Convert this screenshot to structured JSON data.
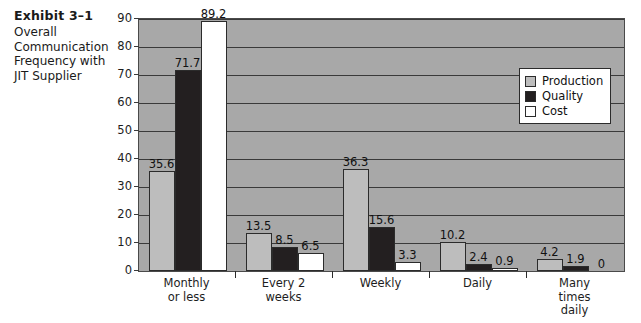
{
  "caption": {
    "exhibit_number": "Exhibit 3–1",
    "description": "Overall\nCommunication\nFrequency with\nJIT Supplier"
  },
  "legend": {
    "position": "inside-top-right",
    "items": [
      {
        "label": "Production",
        "color": "#bdbdbd",
        "icon": "square-swatch"
      },
      {
        "label": "Quality",
        "color": "#231f20",
        "icon": "square-swatch"
      },
      {
        "label": "Cost",
        "color": "#ffffff",
        "icon": "square-swatch"
      }
    ]
  },
  "chart_data": {
    "type": "bar",
    "title": "Overall Communication Frequency with JIT Supplier",
    "xlabel": "",
    "ylabel": "",
    "ylim": [
      0,
      90
    ],
    "yticks": [
      0,
      10,
      20,
      30,
      40,
      50,
      60,
      70,
      80,
      90
    ],
    "ytick_labels": [
      "0",
      "10",
      "20",
      "30",
      "40",
      "50",
      "60",
      "70",
      "80",
      "90"
    ],
    "grid": true,
    "grid_axis": "y",
    "legend_position": "inside-top-right",
    "plot_background": "#a8a8a8",
    "categories": [
      "Monthly\nor less",
      "Every 2\nweeks",
      "Weekly",
      "Daily",
      "Many\ntimes\ndaily"
    ],
    "series": [
      {
        "name": "Production",
        "color": "#bdbdbd",
        "values": [
          35.6,
          13.5,
          36.3,
          10.2,
          4.2
        ],
        "labels": [
          "35.6",
          "13.5",
          "36.3",
          "10.2",
          "4.2"
        ]
      },
      {
        "name": "Quality",
        "color": "#231f20",
        "values": [
          71.7,
          8.5,
          15.6,
          2.4,
          1.9
        ],
        "labels": [
          "71.7",
          "8.5",
          "15.6",
          "2.4",
          "1.9"
        ]
      },
      {
        "name": "Cost",
        "color": "#ffffff",
        "values": [
          89.2,
          6.5,
          3.3,
          0.9,
          0
        ],
        "labels": [
          "89.2",
          "6.5",
          "3.3",
          "0.9",
          "0"
        ]
      }
    ]
  }
}
